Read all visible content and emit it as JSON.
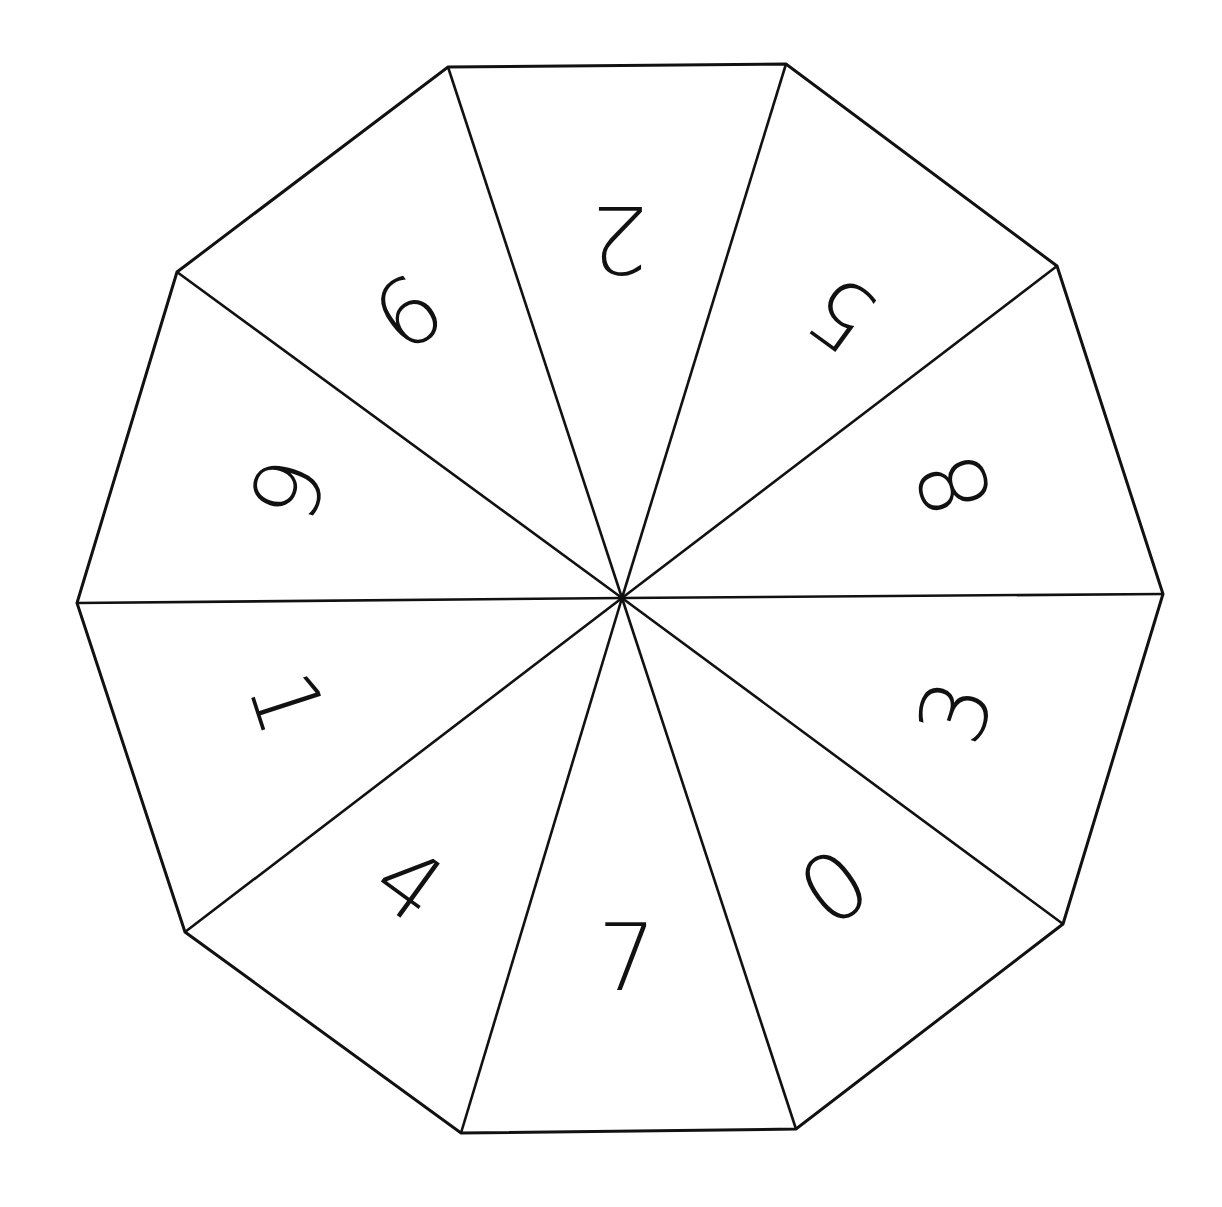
{
  "diagram": {
    "type": "decagon-spinner",
    "colors": {
      "background": "#ffffff",
      "line": "#111111",
      "digit": "#111111"
    },
    "center": [
      622,
      598
    ],
    "vertices": [
      [
        448,
        67
      ],
      [
        786,
        64
      ],
      [
        1057,
        266
      ],
      [
        1163,
        594
      ],
      [
        1063,
        924
      ],
      [
        796,
        1129
      ],
      [
        461,
        1133
      ],
      [
        185,
        932
      ],
      [
        77,
        603
      ],
      [
        177,
        272
      ]
    ],
    "sectors": [
      {
        "label": "2",
        "position": "top",
        "x": 619,
        "y": 238,
        "rotation": 180
      },
      {
        "label": "5",
        "position": "top-right",
        "x": 842,
        "y": 313,
        "rotation": -144
      },
      {
        "label": "8",
        "position": "right-upper",
        "x": 955,
        "y": 485,
        "rotation": -108
      },
      {
        "label": "3",
        "position": "right-lower",
        "x": 956,
        "y": 712,
        "rotation": -72
      },
      {
        "label": "0",
        "position": "bottom-right",
        "x": 835,
        "y": 888,
        "rotation": -36
      },
      {
        "label": "7",
        "position": "bottom",
        "x": 627,
        "y": 958,
        "rotation": 0
      },
      {
        "label": "4",
        "position": "bottom-left",
        "x": 409,
        "y": 885,
        "rotation": 36
      },
      {
        "label": "1",
        "position": "left-lower",
        "x": 286,
        "y": 703,
        "rotation": 72
      },
      {
        "label": "6",
        "position": "left-upper",
        "x": 286,
        "y": 488,
        "rotation": 108
      },
      {
        "label": "9",
        "position": "top-left",
        "x": 407,
        "y": 310,
        "rotation": 144
      }
    ]
  }
}
